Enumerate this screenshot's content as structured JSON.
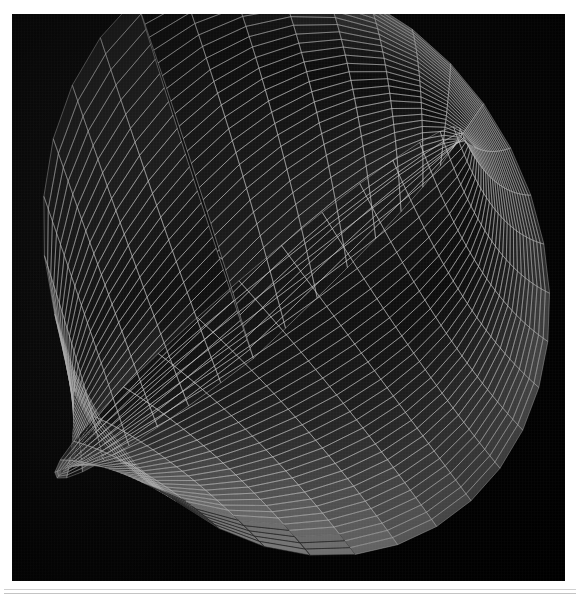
{
  "figure": {
    "title": "3D Surface Mesh Plot",
    "caption": "",
    "background_color": "#ffffff",
    "panel_color": "#050505",
    "panel_rect": {
      "x": 12,
      "y": 14,
      "width": 553,
      "height": 567
    }
  },
  "footer": {
    "rule_top_color": "#d0d0d0",
    "rule_bottom_color": "#c4c4c4"
  },
  "chart_data": {
    "type": "surface",
    "title": "3D Surface Mesh Plot",
    "subtitle": "",
    "xlabel": "",
    "ylabel": "",
    "zlabel": "",
    "style": "wireframe-shaded-grayscale",
    "background": "#000000",
    "grid": false,
    "legend": null,
    "legend_position": "none",
    "colormap": {
      "name": "grayscale",
      "low": "#0a0a0a",
      "mid": "#7a7a7a",
      "high": "#f2f2f2"
    },
    "mesh": {
      "u_divisions": 34,
      "v_divisions": 30,
      "line_color": "#c8c8c8",
      "line_width": 0.55,
      "face_opacity": 1.0
    },
    "surface": {
      "family": "saddle / ruled hyperbolic sheet",
      "u_range": [
        -1.0,
        1.0
      ],
      "v_range": [
        -1.0,
        1.0
      ],
      "note": "two-lobed warped sheet with a central fold and a sweeping right wing"
    },
    "projection": {
      "kind": "perspective",
      "azimuth_deg": -42,
      "elevation_deg": 22,
      "distance": 7.2,
      "scale": 215
    },
    "axes_lines": [
      {
        "name": "axis-line-long",
        "x1": 152,
        "y1": 214,
        "x2": 448,
        "y2": 404,
        "color": "#8c8c8c"
      },
      {
        "name": "axis-line-short",
        "x1": 160,
        "y1": 300,
        "x2": 232,
        "y2": 239,
        "color": "#8c8c8c"
      }
    ],
    "zlim": [
      -1.0,
      1.0
    ],
    "xlim": [
      -1.0,
      1.0
    ],
    "ylim": [
      -1.0,
      1.0
    ],
    "tick_labels": {
      "x": [],
      "y": [],
      "z": []
    },
    "annotations": []
  }
}
